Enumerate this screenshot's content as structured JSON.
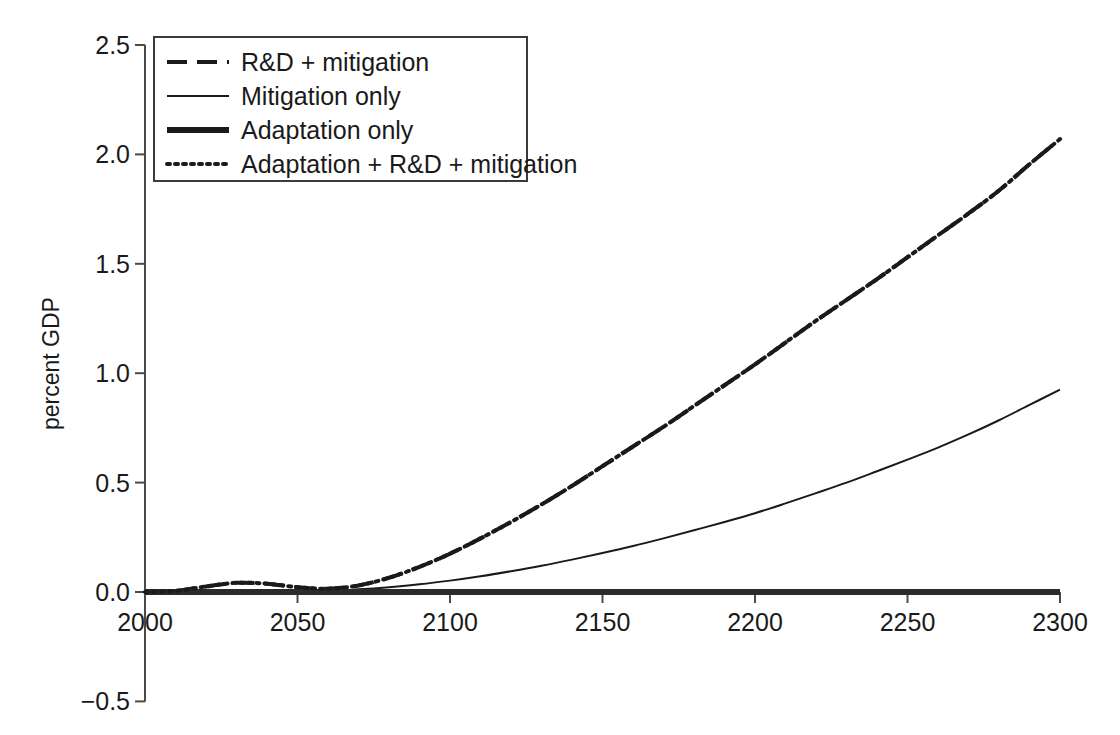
{
  "chart_data": {
    "type": "line",
    "title": "",
    "subtitle": "",
    "xlabel": "",
    "ylabel": "percent GDP",
    "xlim": [
      2000,
      2300
    ],
    "ylim": [
      -0.5,
      2.5
    ],
    "xticks": [
      "2000",
      "2050",
      "2100",
      "2150",
      "2200",
      "2250",
      "2300"
    ],
    "xtick_values": [
      2000,
      2050,
      2100,
      2150,
      2200,
      2250,
      2300
    ],
    "yticks": [
      "2.5",
      "2.0",
      "1.5",
      "1.0",
      "0.5",
      "0.0",
      "−0.5"
    ],
    "ytick_values": [
      2.5,
      2.0,
      1.5,
      1.0,
      0.5,
      0.0,
      -0.5
    ],
    "grid": false,
    "legend_position": "top-left",
    "x": [
      2000,
      2010,
      2020,
      2030,
      2040,
      2050,
      2060,
      2070,
      2080,
      2090,
      2100,
      2110,
      2120,
      2130,
      2140,
      2150,
      2160,
      2170,
      2180,
      2190,
      2200,
      2210,
      2220,
      2230,
      2240,
      2250,
      2260,
      2270,
      2280,
      2290,
      2300
    ],
    "series": [
      {
        "name": "R&D + mitigation",
        "style": "dashed",
        "color": "#1a1a1a",
        "width": 4,
        "values": [
          0.0,
          0.005,
          0.025,
          0.042,
          0.038,
          0.022,
          0.015,
          0.03,
          0.065,
          0.115,
          0.175,
          0.245,
          0.32,
          0.4,
          0.485,
          0.575,
          0.665,
          0.755,
          0.85,
          0.945,
          1.04,
          1.14,
          1.24,
          1.335,
          1.43,
          1.53,
          1.63,
          1.73,
          1.835,
          1.955,
          2.07
        ]
      },
      {
        "name": "Mitigation only",
        "style": "solid-thin",
        "color": "#1a1a1a",
        "width": 2,
        "values": [
          0.0,
          0.0,
          0.0,
          0.0,
          0.0,
          0.0,
          0.005,
          0.012,
          0.022,
          0.035,
          0.052,
          0.072,
          0.095,
          0.12,
          0.148,
          0.178,
          0.21,
          0.245,
          0.282,
          0.32,
          0.36,
          0.405,
          0.452,
          0.5,
          0.552,
          0.605,
          0.66,
          0.72,
          0.785,
          0.855,
          0.925
        ]
      },
      {
        "name": "Adaptation only",
        "style": "solid-thick",
        "color": "#2b2b2b",
        "width": 6,
        "values": [
          0.0,
          0.0,
          0.0,
          0.0,
          0.0,
          0.0,
          0.0,
          0.0,
          0.0,
          0.0,
          0.0,
          0.0,
          0.0,
          0.0,
          0.0,
          0.0,
          0.0,
          0.0,
          0.0,
          0.0,
          0.0,
          0.0,
          0.0,
          0.0,
          0.0,
          0.0,
          0.0,
          0.0,
          0.0,
          0.0,
          0.0
        ]
      },
      {
        "name": "Adaptation + R&D + mitigation",
        "style": "dotted",
        "color": "#1a1a1a",
        "width": 4,
        "values": [
          0.0,
          0.005,
          0.025,
          0.042,
          0.038,
          0.022,
          0.015,
          0.03,
          0.065,
          0.115,
          0.175,
          0.245,
          0.32,
          0.4,
          0.485,
          0.575,
          0.665,
          0.755,
          0.85,
          0.945,
          1.04,
          1.14,
          1.24,
          1.335,
          1.43,
          1.53,
          1.63,
          1.73,
          1.835,
          1.955,
          2.07
        ]
      }
    ]
  },
  "legend": {
    "items": [
      {
        "label": "R&D + mitigation",
        "style": "dashed"
      },
      {
        "label": "Mitigation only",
        "style": "solid-thin"
      },
      {
        "label": "Adaptation only",
        "style": "solid-thick"
      },
      {
        "label": "Adaptation + R&D + mitigation",
        "style": "dotted"
      }
    ]
  },
  "axes": {
    "y_title": "percent GDP",
    "y_labels": [
      "2.5",
      "2.0",
      "1.5",
      "1.0",
      "0.5",
      "0.0",
      "−0.5"
    ],
    "x_labels": [
      "2000",
      "2050",
      "2100",
      "2150",
      "2200",
      "2250",
      "2300"
    ]
  }
}
